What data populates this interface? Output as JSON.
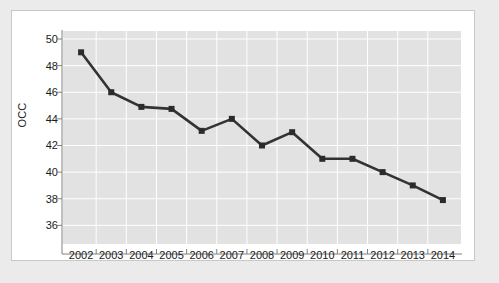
{
  "chart_data": {
    "type": "line",
    "title": "",
    "xlabel": "",
    "ylabel": "OCC",
    "categories": [
      "2002",
      "2003",
      "2004",
      "2005",
      "2006",
      "2007",
      "2008",
      "2009",
      "2010",
      "2011",
      "2012",
      "2013",
      "2014"
    ],
    "x": [
      2002,
      2003,
      2004,
      2005,
      2006,
      2007,
      2008,
      2009,
      2010,
      2011,
      2012,
      2013,
      2014
    ],
    "values": [
      49.0,
      46.0,
      44.9,
      44.75,
      43.1,
      44.0,
      42.0,
      43.0,
      41.0,
      41.0,
      40.0,
      39.0,
      37.9
    ],
    "series": [
      {
        "name": "OCC",
        "values": [
          49.0,
          46.0,
          44.9,
          44.75,
          43.1,
          44.0,
          42.0,
          43.0,
          41.0,
          41.0,
          40.0,
          39.0,
          37.9
        ]
      }
    ],
    "ylim": [
      34.6,
      50.6
    ],
    "xlim": [
      2001.4,
      2014.6
    ],
    "yticks": [
      36,
      38,
      40,
      42,
      44,
      46,
      48,
      50
    ],
    "ytick_labels": [
      "36",
      "38",
      "40",
      "42",
      "44",
      "46",
      "48",
      "50"
    ],
    "xticks": [
      2002,
      2003,
      2004,
      2005,
      2006,
      2007,
      2008,
      2009,
      2010,
      2011,
      2012,
      2013,
      2014
    ],
    "xtick_labels": [
      "2002",
      "2003",
      "2004",
      "2005",
      "2006",
      "2007",
      "2008",
      "2009",
      "2010",
      "2011",
      "2012",
      "2013",
      "2014"
    ],
    "grid": true,
    "legend": false,
    "marker": "square",
    "colors": {
      "line": "#333333",
      "marker": "#2b2b2b",
      "plot_background": "#e2e2e2",
      "gridline": "#ffffff",
      "figure_background": "#ffffff",
      "page_background": "#ebebeb",
      "axis": "#808080",
      "text": "#1a1a1a"
    }
  }
}
